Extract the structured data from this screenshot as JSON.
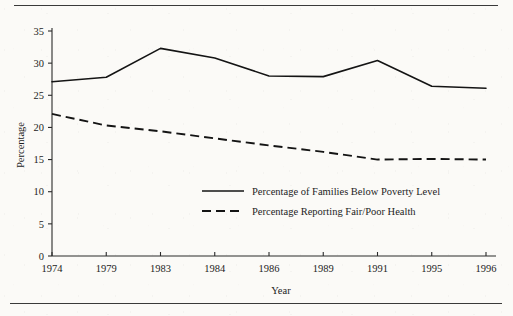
{
  "figure": {
    "background_color": "#fbfaf7",
    "ink_color": "#141414",
    "rule_color": "#3a3a3a"
  },
  "axes": {
    "y_title": "Percentage",
    "x_title": "Year"
  },
  "chart_data": {
    "type": "line",
    "title": "",
    "subtitle": "",
    "xlabel": "Year",
    "ylabel": "Percentage",
    "categories": [
      "1974",
      "1979",
      "1983",
      "1984",
      "1986",
      "1989",
      "1991",
      "1995",
      "1996"
    ],
    "x_tick_labels": [
      "1974",
      "1979",
      "1983",
      "1984",
      "1986",
      "1989",
      "1991",
      "1995",
      "1996"
    ],
    "y_tick_labels": [
      "0",
      "5",
      "10",
      "15",
      "20",
      "25",
      "30",
      "35"
    ],
    "y_ticks": [
      0,
      5,
      10,
      15,
      20,
      25,
      30,
      35
    ],
    "ylim": [
      0,
      35
    ],
    "grid": false,
    "legend_position": "inside-center",
    "series": [
      {
        "name": "Percentage of Families Below Poverty Level",
        "style": "solid",
        "color": "#141414",
        "values": [
          27.1,
          27.8,
          32.3,
          30.8,
          28.0,
          27.9,
          30.4,
          26.4,
          26.1
        ]
      },
      {
        "name": "Percentage Reporting Fair/Poor Health",
        "style": "dashed",
        "color": "#141414",
        "values": [
          22.1,
          20.3,
          19.4,
          18.3,
          17.2,
          16.2,
          15.0,
          15.1,
          15.0
        ]
      }
    ]
  }
}
